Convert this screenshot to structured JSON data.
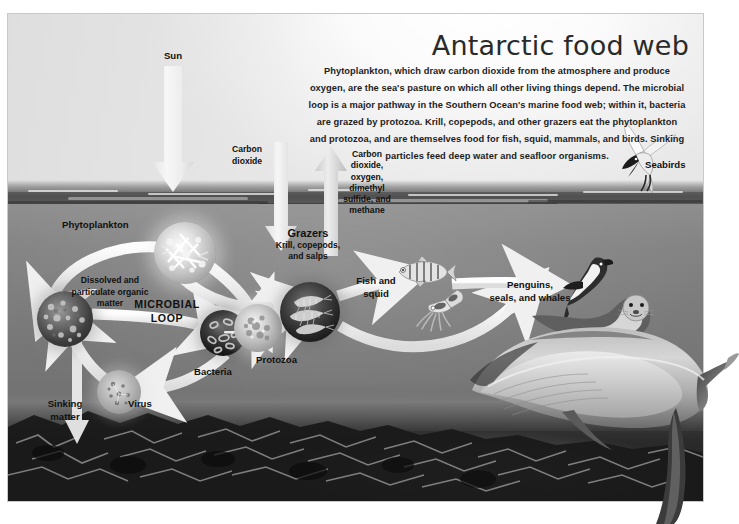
{
  "figure": {
    "title": "Antarctic food web",
    "intro": "Phytoplankton, which draw carbon dioxide from the atmosphere and produce oxygen, are the sea's pasture on which all other living things depend. The microbial loop is a major pathway in the Southern Ocean's marine food web; within it, bacteria are grazed by protozoa. Krill, copepods, and other grazers eat the phytoplankton and protozoa, and are themselves food for fish, squid, mammals, and birds. Sinking particles feed deep water and seafloor organisms."
  },
  "labels": {
    "sun": "Sun",
    "carbon_dioxide_in": "Carbon\ndioxide",
    "gases_out": "Carbon\ndioxide,\noxygen,\ndimethyl\nsulfide, and\nmethane",
    "seabirds": "Seabirds",
    "phytoplankton": "Phytoplankton",
    "dissolved_matter": "Dissolved and\nparticulate organic\nmatter",
    "microbial_loop": "MICROBIAL\nLOOP",
    "bacteria": "Bacteria",
    "protozoa": "Protozoa",
    "virus": "Virus",
    "sinking_matter": "Sinking\nmatter",
    "grazers": "Grazers",
    "grazers_sub": "Krill, copepods,\nand salps",
    "fish_and_squid": "Fish and\nsquid",
    "predators": "Penguins,\nseals, and whales"
  },
  "colors": {
    "page_background": "#ffffff",
    "sky": "#f3f3f3",
    "ocean": "#7c7c7c",
    "seafloor": "#2b2b2b",
    "arrow": "#f0f0f0",
    "text": "#1d1d1d",
    "title": "#2a2a2a"
  },
  "icons": {
    "sun_arrow": "downward-arrow-icon",
    "co2_arrow": "downward-arrow-icon",
    "gas_arrow": "upward-arrow-icon",
    "loop_arrow": "curved-arrow-icon",
    "seabird": "tern-icon",
    "fish": "fish-icon",
    "squid": "squid-icon",
    "penguin": "penguin-icon",
    "seal": "seal-icon",
    "whale": "whale-icon"
  }
}
